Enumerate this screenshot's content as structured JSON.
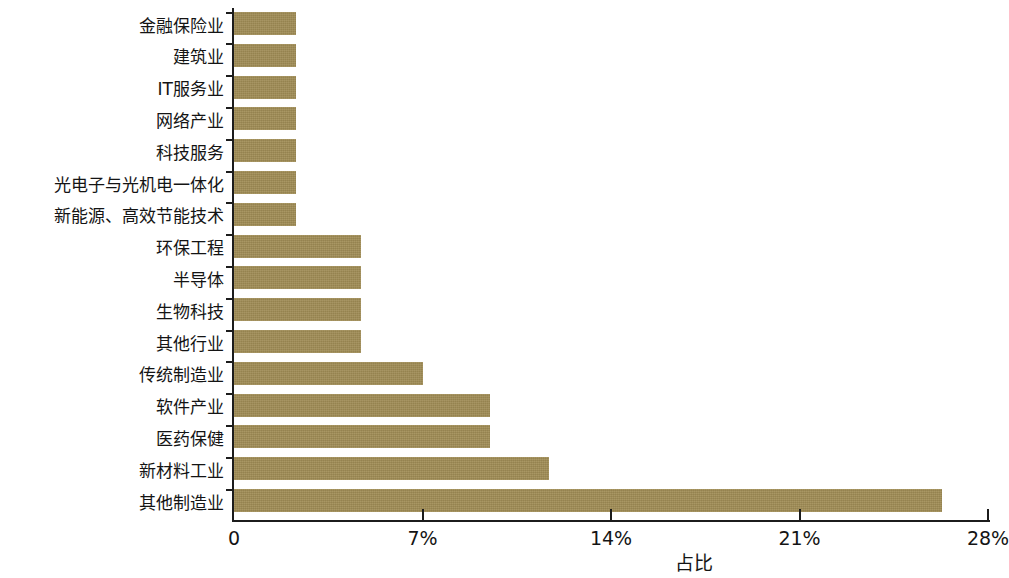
{
  "chart_data": {
    "type": "bar",
    "orientation": "horizontal",
    "title": "",
    "subtitle": "",
    "xlabel": "占比",
    "ylabel": "",
    "xlim": [
      0,
      28
    ],
    "xunit": "%",
    "grid": false,
    "legend": null,
    "bar_color": "#a08c55",
    "axis_color": "#1c1c1c",
    "xticks": [
      {
        "value": 0,
        "label": "0"
      },
      {
        "value": 7,
        "label": "7%"
      },
      {
        "value": 14,
        "label": "14%"
      },
      {
        "value": 21,
        "label": "21%"
      },
      {
        "value": 28,
        "label": "28%"
      }
    ],
    "categories": [
      "金融保险业",
      "建筑业",
      "IT服务业",
      "网络产业",
      "科技服务",
      "光电子与光机电一体化",
      "新能源、高效节能技术",
      "环保工程",
      "半导体",
      "生物科技",
      "其他行业",
      "传统制造业",
      "软件产业",
      "医药保健",
      "新材料工业",
      "其他制造业"
    ],
    "values": [
      2.3,
      2.3,
      2.3,
      2.3,
      2.3,
      2.3,
      2.3,
      4.7,
      4.7,
      4.7,
      4.7,
      7.0,
      9.5,
      9.5,
      11.7,
      26.3
    ]
  }
}
